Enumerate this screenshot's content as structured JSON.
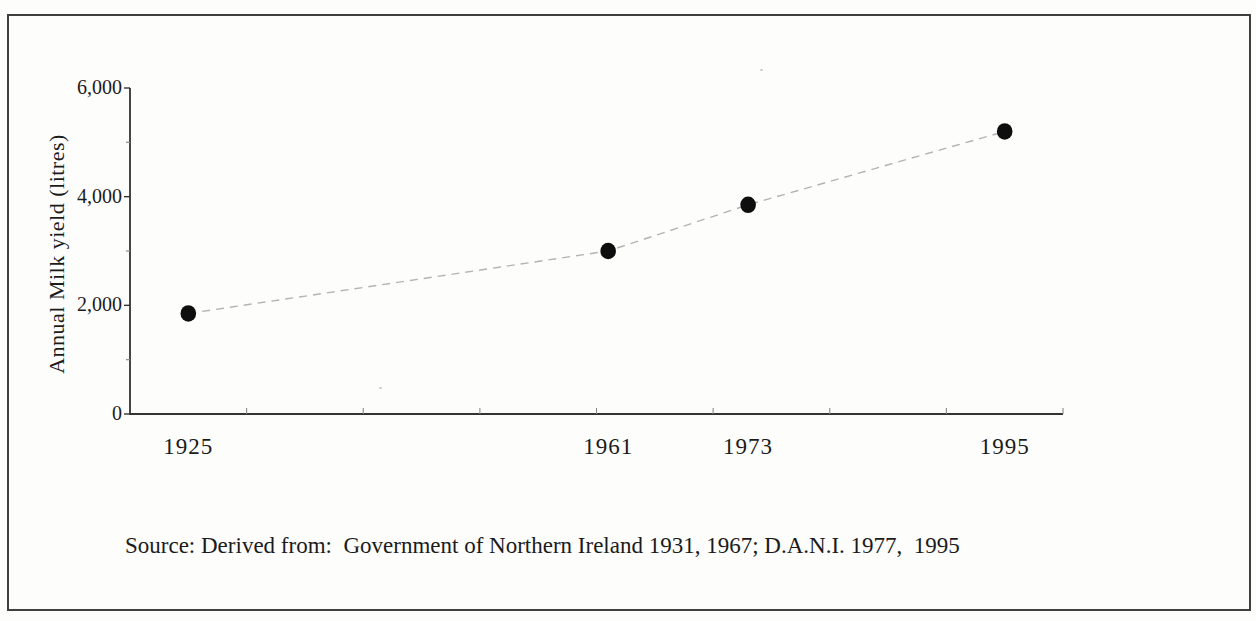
{
  "figure": {
    "background": "#fdfdfc",
    "border_color": "#3f3f3f",
    "text_color": "#1b1b1b"
  },
  "chart_data": {
    "type": "scatter",
    "title": "",
    "xlabel": "",
    "ylabel": "Annual Milk yield (litres)",
    "categories": [
      "1925",
      "1961",
      "1973",
      "1995"
    ],
    "x": [
      1925,
      1961,
      1973,
      1995
    ],
    "values": [
      1850,
      3000,
      3850,
      5200
    ],
    "series_name": "Annual milk yield",
    "xlim": [
      1920,
      2000
    ],
    "ylim": [
      0,
      6000
    ],
    "y_ticks_major": [
      0,
      2000,
      4000,
      6000
    ],
    "y_tick_labels": [
      "0",
      "2,000",
      "4,000",
      "6,000"
    ],
    "y_ticks_minor": [
      1000,
      3000,
      5000
    ],
    "x_minor_ticks": [
      1930,
      1940,
      1950,
      1960,
      1970,
      1980,
      1990,
      2000
    ],
    "grid": false,
    "legend": false,
    "line_style": "dashed",
    "marker": "filled-circle",
    "marker_color": "#0e0e0e",
    "line_color": "#b3b3b3",
    "axis_color": "#333333",
    "minor_tick_color": "#8a8a8a"
  },
  "source_note": "Source: Derived from:  Government of Northern Ireland 1931, 1967; D.A.N.I. 1977,  1995"
}
